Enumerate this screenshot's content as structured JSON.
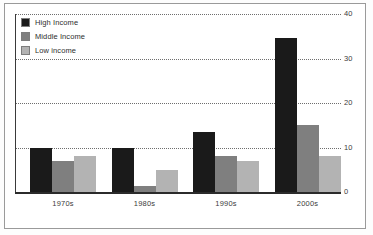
{
  "chart_data": {
    "type": "bar",
    "title": "",
    "xlabel": "",
    "ylabel": "",
    "categories": [
      "1970s",
      "1980s",
      "1990s",
      "2000s"
    ],
    "series": [
      {
        "name": "High Income",
        "color": "#1a1a1a",
        "values": [
          10,
          10,
          13.5,
          34.5
        ]
      },
      {
        "name": "Middle Income",
        "color": "#7f7f7f",
        "values": [
          7,
          1.3,
          8,
          15
        ]
      },
      {
        "name": "Low income",
        "color": "#b3b3b3",
        "values": [
          8,
          5,
          7,
          8
        ]
      }
    ],
    "ylim": [
      0,
      40
    ],
    "yticks": [
      0,
      10,
      20,
      30,
      40
    ],
    "ytick_labels": [
      "0",
      "10",
      "20",
      "30",
      "40"
    ],
    "y_axis_position": "right",
    "grid": true,
    "grid_style": "dotted",
    "legend_position": "top-left"
  },
  "legend": {
    "items": [
      {
        "label": "High Income",
        "color": "#1a1a1a"
      },
      {
        "label": "Middle Income",
        "color": "#7f7f7f"
      },
      {
        "label": "Low income",
        "color": "#b3b3b3"
      }
    ]
  },
  "colors": {
    "high_income": "#1a1a1a",
    "middle_income": "#7f7f7f",
    "low_income": "#b3b3b3",
    "axis": "#2b2b2b",
    "grid": "#6e6e6e",
    "frame": "#9a9a9a",
    "background": "#ffffff"
  }
}
